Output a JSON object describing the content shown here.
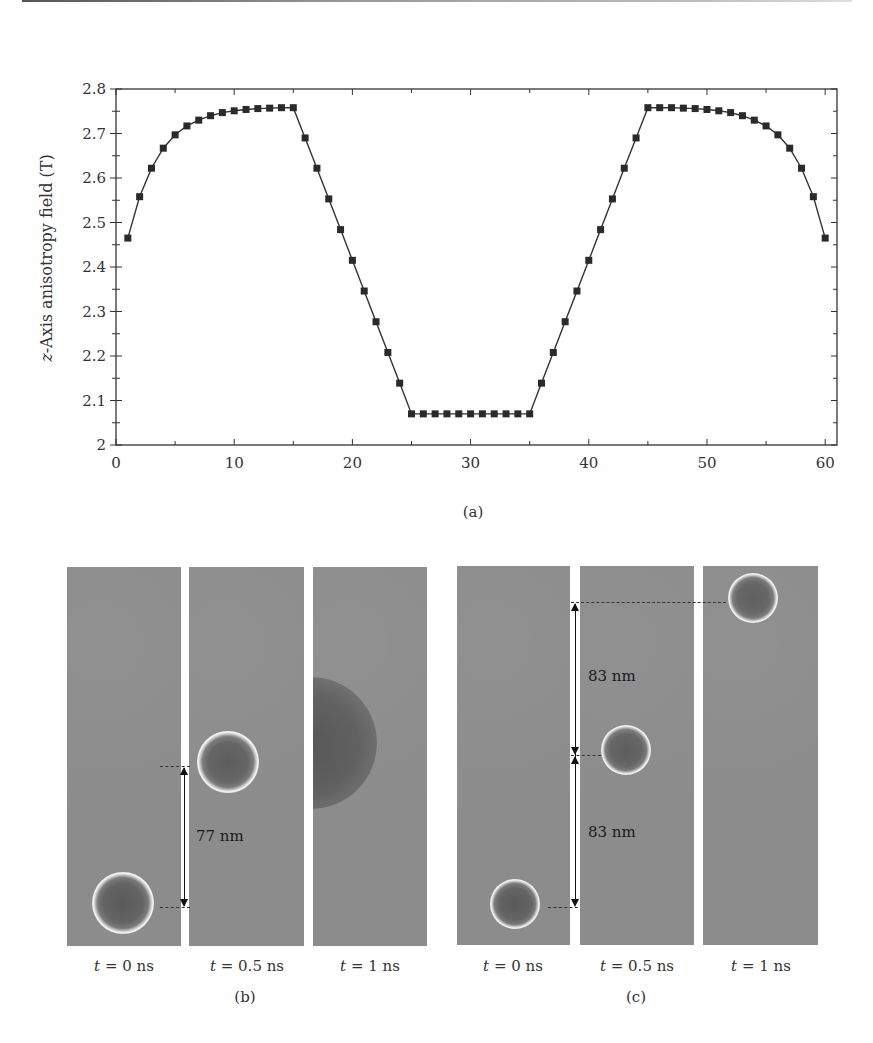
{
  "figure": {
    "panel_a_label": "(a)",
    "panel_b_label": "(b)",
    "panel_c_label": "(c)"
  },
  "chart_data": {
    "type": "line",
    "title": "",
    "xlabel": "X position (nm)",
    "ylabel_italic": "z",
    "ylabel": "z-Axis anisotropy field (T)",
    "ylabel_rest": "-Axis anisotropy field (T)",
    "xlim": [
      0,
      61
    ],
    "ylim": [
      2,
      2.8
    ],
    "xticks": [
      0,
      10,
      20,
      30,
      40,
      50,
      60
    ],
    "yticks": [
      2,
      2.1,
      2.2,
      2.3,
      2.4,
      2.5,
      2.6,
      2.7,
      2.8
    ],
    "ytick_labels": [
      "2",
      "2.1",
      "2.2",
      "2.3",
      "2.4",
      "2.5",
      "2.6",
      "2.7",
      "2.8"
    ],
    "marker": "square",
    "grid": false,
    "legend": null,
    "series": [
      {
        "name": "anisotropy field",
        "x": [
          1,
          2,
          3,
          4,
          5,
          6,
          7,
          8,
          9,
          10,
          11,
          12,
          13,
          14,
          15,
          16,
          17,
          18,
          19,
          20,
          21,
          22,
          23,
          24,
          25,
          26,
          27,
          28,
          29,
          30,
          31,
          32,
          33,
          34,
          35,
          36,
          37,
          38,
          39,
          40,
          41,
          42,
          43,
          44,
          45,
          46,
          47,
          48,
          49,
          50,
          51,
          52,
          53,
          54,
          55,
          56,
          57,
          58,
          59,
          60
        ],
        "y": [
          2.465,
          2.558,
          2.622,
          2.667,
          2.697,
          2.717,
          2.73,
          2.74,
          2.747,
          2.751,
          2.754,
          2.756,
          2.757,
          2.758,
          2.758,
          2.69,
          2.622,
          2.553,
          2.484,
          2.415,
          2.346,
          2.277,
          2.208,
          2.139,
          2.07,
          2.07,
          2.07,
          2.07,
          2.07,
          2.07,
          2.07,
          2.07,
          2.07,
          2.07,
          2.07,
          2.139,
          2.208,
          2.277,
          2.346,
          2.415,
          2.484,
          2.553,
          2.622,
          2.69,
          2.758,
          2.758,
          2.758,
          2.757,
          2.756,
          2.754,
          2.751,
          2.747,
          2.74,
          2.73,
          2.717,
          2.697,
          2.667,
          2.622,
          2.558,
          2.465
        ]
      }
    ]
  },
  "panel_b": {
    "frames": [
      {
        "label_t": "t",
        "label_rest": " = 0 ns"
      },
      {
        "label_t": "t",
        "label_rest": " = 0.5 ns"
      },
      {
        "label_t": "t",
        "label_rest": " = 1 ns"
      }
    ],
    "distance_label": "77 nm"
  },
  "panel_c": {
    "frames": [
      {
        "label_t": "t",
        "label_rest": " = 0 ns"
      },
      {
        "label_t": "t",
        "label_rest": " = 0.5 ns"
      },
      {
        "label_t": "t",
        "label_rest": " = 1 ns"
      }
    ],
    "distance_label_upper": "83 nm",
    "distance_label_lower": "83 nm"
  }
}
